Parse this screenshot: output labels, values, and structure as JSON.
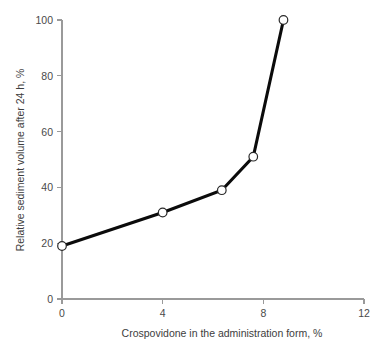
{
  "figure": {
    "background_color": "#ffffff",
    "width": 379,
    "height": 344
  },
  "chart_data": {
    "type": "line",
    "title": "",
    "subtitle": "",
    "xlabel": "Crospovidone in the administration form, %",
    "ylabel": "Relative sediment volume after 24 h, %",
    "xlim": [
      0,
      12
    ],
    "ylim": [
      0,
      100
    ],
    "xticks": [
      0,
      4,
      8,
      12
    ],
    "yticks": [
      0,
      20,
      40,
      60,
      80,
      100
    ],
    "xtick_labels": [
      "0",
      "4",
      "8",
      "12"
    ],
    "ytick_labels": [
      "0",
      "20",
      "40",
      "60",
      "80",
      "100"
    ],
    "grid": false,
    "legend": null,
    "annotations": [],
    "line_color": "#0b0b0b",
    "marker_style": "open-circle",
    "marker_face_color": "#ffffff",
    "marker_edge_color": "#2a2a2a",
    "axis_color": "#9a9a9a",
    "series": [
      {
        "name": "Relative sediment volume after 24 h",
        "x": [
          0,
          4,
          6.35,
          7.6,
          8.8
        ],
        "values": [
          19,
          31,
          39,
          51,
          100
        ]
      }
    ]
  }
}
